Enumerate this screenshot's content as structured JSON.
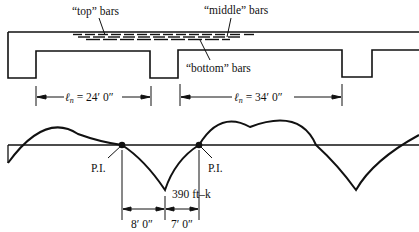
{
  "labels": {
    "top_bars": "“top” bars",
    "middle_bars": "“middle” bars",
    "bottom_bars": "“bottom” bars",
    "span1_ln": "ℓ",
    "span1_sub": "n",
    "span1_value": " = 24′ 0″",
    "span2_ln": "ℓ",
    "span2_sub": "n",
    "span2_value": " = 34′ 0″",
    "pi_left": "P.I.",
    "pi_right": "P.I.",
    "moment": "390 ft–k",
    "dim_left": "8′ 0″",
    "dim_right": "7′ 0″"
  },
  "colors": {
    "ink": "#111111",
    "background": "#ffffff"
  }
}
